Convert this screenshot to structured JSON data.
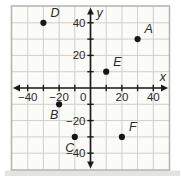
{
  "figure": {
    "background": "#ffffff",
    "plot_background": "#fbfbf8",
    "frame_color": "#b6b6b2",
    "grid_color": "#cdd1cd",
    "axis_color": "#1c1c1c",
    "tick_color": "#1c1c1c",
    "point_color": "#161616",
    "text_color": "#2a2a2a",
    "shadow_color": "#d9d9d5"
  },
  "chart_data": {
    "type": "scatter",
    "title": "",
    "xlabel": "x",
    "ylabel": "y",
    "xlim": [
      -50,
      50
    ],
    "ylim": [
      -50,
      50
    ],
    "grid": true,
    "grid_step": 10,
    "legend": "none",
    "x_tick_labels": [
      {
        "value": -40,
        "label": "−40"
      },
      {
        "value": -20,
        "label": "−20"
      },
      {
        "value": 0,
        "label": "0"
      },
      {
        "value": 20,
        "label": "20"
      },
      {
        "value": 40,
        "label": "40"
      }
    ],
    "y_tick_labels": [
      {
        "value": 40,
        "label": "40"
      },
      {
        "value": 20,
        "label": "20"
      },
      {
        "value": -20,
        "label": "−20"
      },
      {
        "value": -40,
        "label": "−40"
      }
    ],
    "tick_mark_step": 10,
    "points": [
      {
        "name": "A",
        "x": 30,
        "y": 30,
        "label_pos": "above-right"
      },
      {
        "name": "B",
        "x": -20,
        "y": -10,
        "label_pos": "below-left"
      },
      {
        "name": "C",
        "x": -10,
        "y": -30,
        "label_pos": "below-left"
      },
      {
        "name": "D",
        "x": -30,
        "y": 40,
        "label_pos": "above-right"
      },
      {
        "name": "E",
        "x": 10,
        "y": 10,
        "label_pos": "above-right"
      },
      {
        "name": "F",
        "x": 20,
        "y": -30,
        "label_pos": "above-right"
      }
    ]
  }
}
